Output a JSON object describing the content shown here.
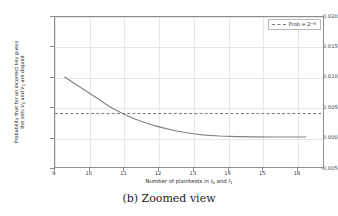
{
  "caption": "(b) Zoomed view",
  "chart_data": {
    "type": "line",
    "title": "",
    "xlabel": "Number of plaintexts in I₀ and I₁",
    "ylabel": "Probability that for an incorrect key guess the sets V₀ and V₁ are disjoint",
    "ylabel_line1": "Probability that for an incorrect key guess",
    "ylabel_line2": "the sets V₀ and V₁ are disjoint",
    "xlim": [
      8.72,
      16.5
    ],
    "ylim": [
      -0.005,
      0.02
    ],
    "xticks": [
      9,
      10,
      11,
      12,
      13,
      14,
      15,
      16
    ],
    "xticklabels": [
      "9",
      "10",
      "11",
      "12",
      "13",
      "14",
      "15",
      "16"
    ],
    "yticks": [
      -0.005,
      0.0,
      0.005,
      0.01,
      0.015,
      0.02
    ],
    "yticklabels": [
      "-0.005",
      "0.000",
      "0.005",
      "0.010",
      "0.015",
      "0.020"
    ],
    "grid": true,
    "legend_position": "upper right",
    "series": [
      {
        "name": "disjointness-probability",
        "style": "solid",
        "color": "#808080",
        "x": [
          9.0,
          9.2,
          9.4,
          9.6,
          9.8,
          10.0,
          10.2,
          10.4,
          10.6,
          10.8,
          11.0,
          11.2,
          11.4,
          11.6,
          11.8,
          12.0,
          12.25,
          12.5,
          12.75,
          13.0,
          13.5,
          14.0,
          14.5,
          15.0,
          15.5,
          16.0
        ],
        "y": [
          0.01,
          0.00925,
          0.0085,
          0.00775,
          0.007,
          0.00625,
          0.00545,
          0.00475,
          0.00415,
          0.0036,
          0.0031,
          0.00265,
          0.00225,
          0.0019,
          0.0016,
          0.00132,
          0.001,
          0.00074,
          0.00053,
          0.00036,
          0.00016,
          6e-05,
          2e-05,
          1e-05,
          0.0,
          0.0
        ]
      }
    ],
    "reference_lines": [
      {
        "name": "prob-threshold",
        "orientation": "horizontal",
        "value": 0.00390625,
        "style": "dashed",
        "color": "#777777",
        "legend_label": "Prob = 2⁻⁸",
        "legend_label_base": "Prob = 2",
        "legend_label_exponent": "−8"
      }
    ]
  }
}
